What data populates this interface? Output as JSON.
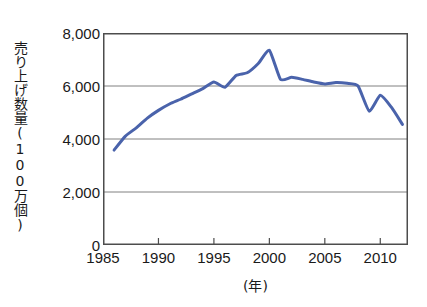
{
  "chart_data": {
    "type": "line",
    "title": "",
    "xlabel": "(年)",
    "ylabel": "売り上げ数量(100万個)",
    "xlim": [
      1985,
      2012.5
    ],
    "ylim": [
      0,
      8000
    ],
    "xticks": [
      1985,
      1990,
      1995,
      2000,
      2005,
      2010
    ],
    "xticklabels": [
      "1985",
      "1990",
      "1995",
      "2000",
      "2005",
      "2010"
    ],
    "yticks": [
      0,
      2000,
      4000,
      6000,
      8000
    ],
    "yticklabels": [
      "0",
      "2,000",
      "4,000",
      "6,000",
      "8,000"
    ],
    "grid": "horizontal",
    "legend": null,
    "line_color": "#4a63ab",
    "line_width": 3,
    "x": [
      1986,
      1987,
      1988,
      1989,
      1990,
      1991,
      1992,
      1993,
      1994,
      1995,
      1996,
      1997,
      1998,
      1999,
      2000,
      2001,
      2002,
      2003,
      2004,
      2005,
      2006,
      2007,
      2008,
      2009,
      2010,
      2011,
      2012
    ],
    "values": [
      3580,
      4100,
      4420,
      4790,
      5080,
      5320,
      5500,
      5700,
      5900,
      6150,
      5950,
      6400,
      6500,
      6850,
      7350,
      6250,
      6330,
      6250,
      6150,
      6080,
      6130,
      6100,
      6000,
      5050,
      5650,
      5200,
      4550
    ],
    "series": [
      {
        "name": "売り上げ数量",
        "values": [
          3580,
          4100,
          4420,
          4790,
          5080,
          5320,
          5500,
          5700,
          5900,
          6150,
          5950,
          6400,
          6500,
          6850,
          7350,
          6250,
          6330,
          6250,
          6150,
          6080,
          6130,
          6100,
          6000,
          5050,
          5650,
          5200,
          4550
        ]
      }
    ]
  },
  "axes": {
    "frame_color": "#4d4d4d",
    "grid_color": "#808080",
    "background": "#ffffff"
  }
}
